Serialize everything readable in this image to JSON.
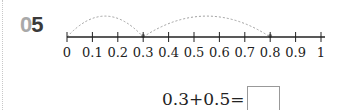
{
  "question": {
    "number_prefix": "0",
    "number_suffix": "5"
  },
  "number_line": {
    "ticks": [
      "0",
      "0.1",
      "0.2",
      "0.3",
      "0.4",
      "0.5",
      "0.6",
      "0.7",
      "0.8",
      "0.9",
      "1"
    ],
    "start": 0,
    "end": 1,
    "step": 0.1,
    "jumps": [
      {
        "from": 0,
        "to": 0.3
      },
      {
        "from": 0.3,
        "to": 0.8
      }
    ]
  },
  "equation": {
    "expression": "0.3+0.5=",
    "answer": ""
  },
  "colors": {
    "line": "#222222",
    "arc": "#a0a0a0",
    "number_light": "#a9a9a9",
    "number_dark": "#3a3a3a"
  }
}
